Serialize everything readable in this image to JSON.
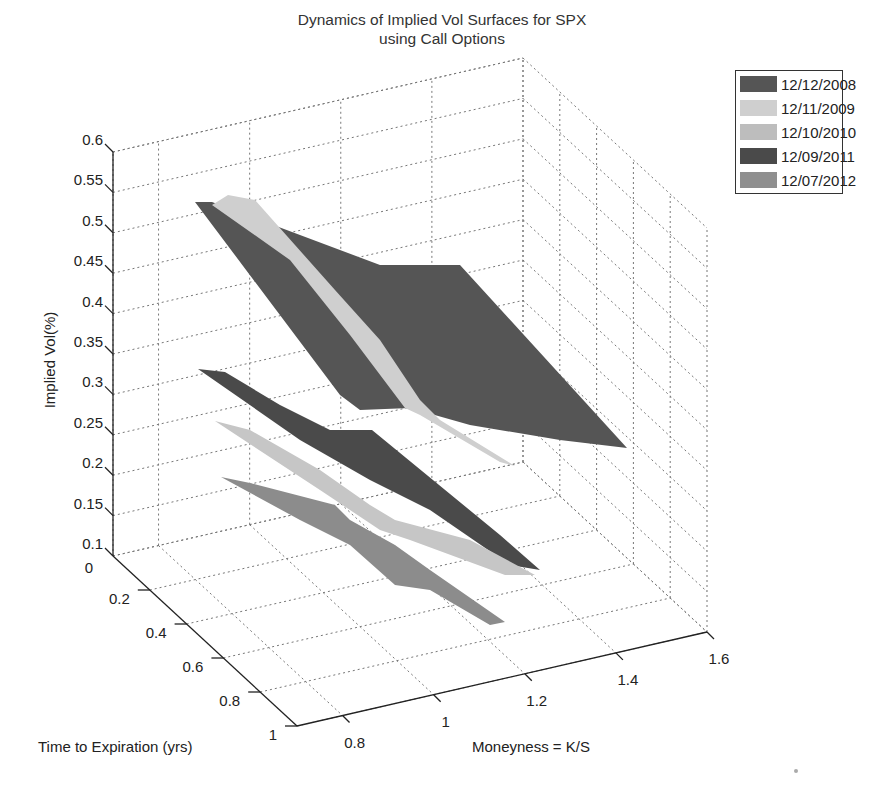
{
  "chart_data": {
    "type": "surface3d",
    "title": "Dynamics of Implied Vol Surfaces for SPX",
    "subtitle": "using Call Options",
    "xlabel": "Moneyness = K/S",
    "ylabel": "Time to Expiration (yrs)",
    "zlabel": "Implied Vol(%)",
    "x_ticks": [
      "0.8",
      "1",
      "1.2",
      "1.4",
      "1.6"
    ],
    "y_ticks": [
      "0",
      "0.2",
      "0.4",
      "0.6",
      "0.8",
      "1"
    ],
    "z_ticks": [
      "0.1",
      "0.15",
      "0.2",
      "0.25",
      "0.3",
      "0.35",
      "0.4",
      "0.45",
      "0.5",
      "0.55",
      "0.6"
    ],
    "xlim": [
      0.7,
      1.6
    ],
    "ylim": [
      0,
      1
    ],
    "zlim": [
      0.1,
      0.6
    ],
    "grid": true,
    "legend_position": "top-right",
    "series": [
      {
        "name": "12/12/2008",
        "color": "#555555",
        "approx_vol_range": [
          0.27,
          0.53
        ]
      },
      {
        "name": "12/11/2009",
        "color": "#c8c8c8",
        "approx_vol_range": [
          0.22,
          0.54
        ]
      },
      {
        "name": "12/10/2010",
        "color": "#bdbdbd",
        "approx_vol_range": [
          0.17,
          0.27
        ]
      },
      {
        "name": "12/09/2011",
        "color": "#4a4a4a",
        "approx_vol_range": [
          0.19,
          0.31
        ]
      },
      {
        "name": "12/07/2012",
        "color": "#8c8c8c",
        "approx_vol_range": [
          0.13,
          0.21
        ]
      }
    ]
  },
  "legend": {
    "items": [
      {
        "label": "12/12/2008",
        "color": "#555555"
      },
      {
        "label": "12/11/2009",
        "color": "#cfcfcf"
      },
      {
        "label": "12/10/2010",
        "color": "#bdbdbd"
      },
      {
        "label": "12/09/2011",
        "color": "#4a4a4a"
      },
      {
        "label": "12/07/2012",
        "color": "#8f8f8f"
      }
    ]
  }
}
